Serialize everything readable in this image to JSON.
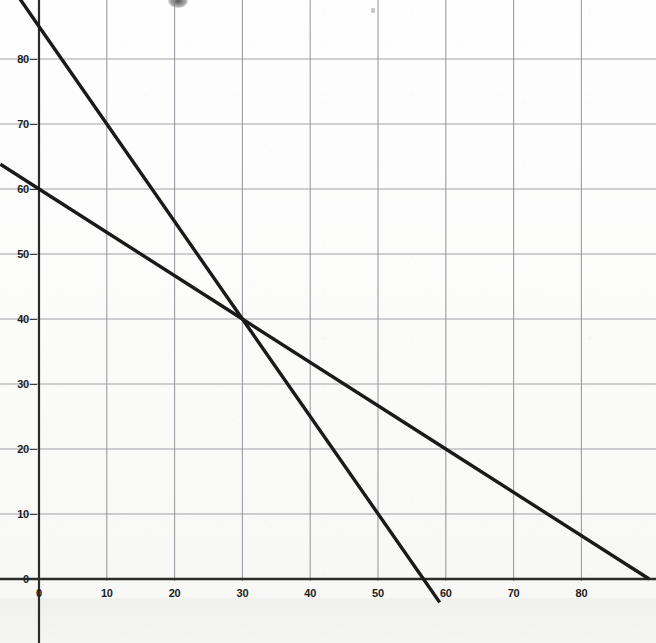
{
  "chart_data": {
    "type": "line",
    "title": "",
    "subtitle": "",
    "xlabel": "",
    "ylabel": "",
    "xlim": [
      -5.7,
      90
    ],
    "ylim": [
      -2.3,
      91
    ],
    "grid": true,
    "legend": "none",
    "annotations": [
      {
        "label": "intersection",
        "x": 30,
        "y": 40
      }
    ],
    "x_ticks": [
      0,
      10,
      20,
      30,
      40,
      50,
      60,
      70,
      80
    ],
    "y_ticks": [
      0,
      10,
      20,
      30,
      40,
      50,
      60,
      70,
      80
    ],
    "x_tick_labels": [
      "0",
      "10",
      "20",
      "30",
      "40",
      "50",
      "60",
      "70",
      "80"
    ],
    "y_tick_labels": [
      "0",
      "10",
      "20",
      "30",
      "40",
      "50",
      "60",
      "70",
      "80"
    ],
    "series": [
      {
        "name": "steep-line",
        "type": "line",
        "slope": -1.5,
        "intercept": 85,
        "x_intercept": 56.7,
        "y_intercept": 85,
        "color": "#1a1a1a",
        "width": 3.4,
        "points": [
          [
            -5.7,
            93.6
          ],
          [
            0,
            85
          ],
          [
            30,
            40
          ],
          [
            56.7,
            0
          ],
          [
            59.1,
            -3.6
          ]
        ]
      },
      {
        "name": "shallow-line",
        "type": "line",
        "slope": -0.6667,
        "intercept": 60,
        "x_intercept": 90,
        "y_intercept": 60,
        "color": "#1a1a1a",
        "width": 3.4,
        "points": [
          [
            -5.7,
            63.8
          ],
          [
            0,
            60
          ],
          [
            30,
            40
          ],
          [
            60,
            20
          ],
          [
            90,
            0
          ]
        ]
      }
    ]
  },
  "axes": {
    "x_axis_name": "x-axis",
    "y_axis_name": "y-axis",
    "axis_color": "#2b2b2b",
    "grid_color": "#8e8e96"
  }
}
